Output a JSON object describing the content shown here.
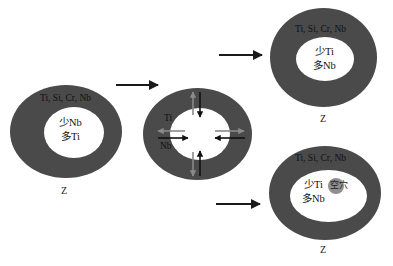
{
  "diagram": {
    "type": "process-schematic",
    "colors": {
      "shell": "#4a4a4a",
      "core": "#ffffff",
      "arrow_black": "#111111",
      "arrow_gray": "#8a8a8a",
      "void": "#8f8f8f"
    },
    "stages": [
      {
        "id": "initial",
        "shell_label": "Ti, Si, Cr, Nb",
        "core_line1": "少Nb",
        "core_line2": "多Ti",
        "caption": "Z"
      },
      {
        "id": "diffusion",
        "diffusion_label_out": "Ti",
        "diffusion_label_in": "Nb",
        "arrows": [
          {
            "direction": "outward",
            "species": "Ti",
            "color": "gray"
          },
          {
            "direction": "inward",
            "species": "Nb",
            "color": "black"
          }
        ]
      },
      {
        "id": "result-dense",
        "shell_label": "Ti, Si, Cr, Nb",
        "core_line1": "少Ti",
        "core_line2": "多Nb",
        "caption": "Z"
      },
      {
        "id": "result-void",
        "shell_label": "Ti, Si, Cr, Nb",
        "core_line1": "少Ti",
        "core_line2": "多Nb",
        "void_label": "空穴",
        "caption": "Z"
      }
    ],
    "flow_arrows": [
      {
        "from": "initial",
        "to": "diffusion"
      },
      {
        "from": "diffusion",
        "to": "result-dense"
      },
      {
        "from": "diffusion",
        "to": "result-void"
      }
    ]
  }
}
